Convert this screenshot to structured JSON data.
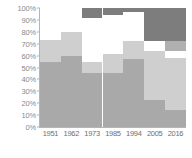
{
  "chart_data": {
    "type": "bar",
    "stacked": true,
    "title": "",
    "subtitle": "",
    "xlabel": "",
    "ylabel": "",
    "ylim": [
      0,
      100
    ],
    "grid": false,
    "legend": "none",
    "categories": [
      "1951",
      "1962",
      "1973",
      "1985",
      "1994",
      "2005",
      "2016"
    ],
    "ytick_labels": [
      "100%",
      "90%",
      "80%",
      "70%",
      "60%",
      "50%",
      "40%",
      "30%",
      "20%",
      "10%",
      "0%"
    ],
    "ytick_values": [
      100,
      90,
      80,
      70,
      60,
      50,
      40,
      30,
      20,
      10,
      0
    ],
    "series": [
      {
        "name": "segment-1",
        "color": "#a9a9a9",
        "values": [
          55,
          60,
          45,
          45,
          57,
          23,
          14
        ]
      },
      {
        "name": "segment-2",
        "color": "#cfcfcf",
        "values": [
          18,
          20,
          10,
          16,
          15,
          41,
          44
        ]
      },
      {
        "name": "segment-3",
        "color": "#ffffff",
        "values": [
          27,
          20,
          37,
          33,
          25,
          8,
          6
        ]
      },
      {
        "name": "segment-4",
        "color": "#b0b0b0",
        "values": [
          0,
          0,
          0,
          0,
          0,
          0,
          8
        ]
      },
      {
        "name": "segment-5",
        "color": "#7d7d7d",
        "values": [
          0,
          0,
          8,
          6,
          3,
          28,
          28
        ]
      }
    ]
  },
  "axis": {
    "line_color": "#b5b5b5",
    "tick_label_color": "#8a8a8a",
    "x_label_color": "#6f6f6f"
  }
}
